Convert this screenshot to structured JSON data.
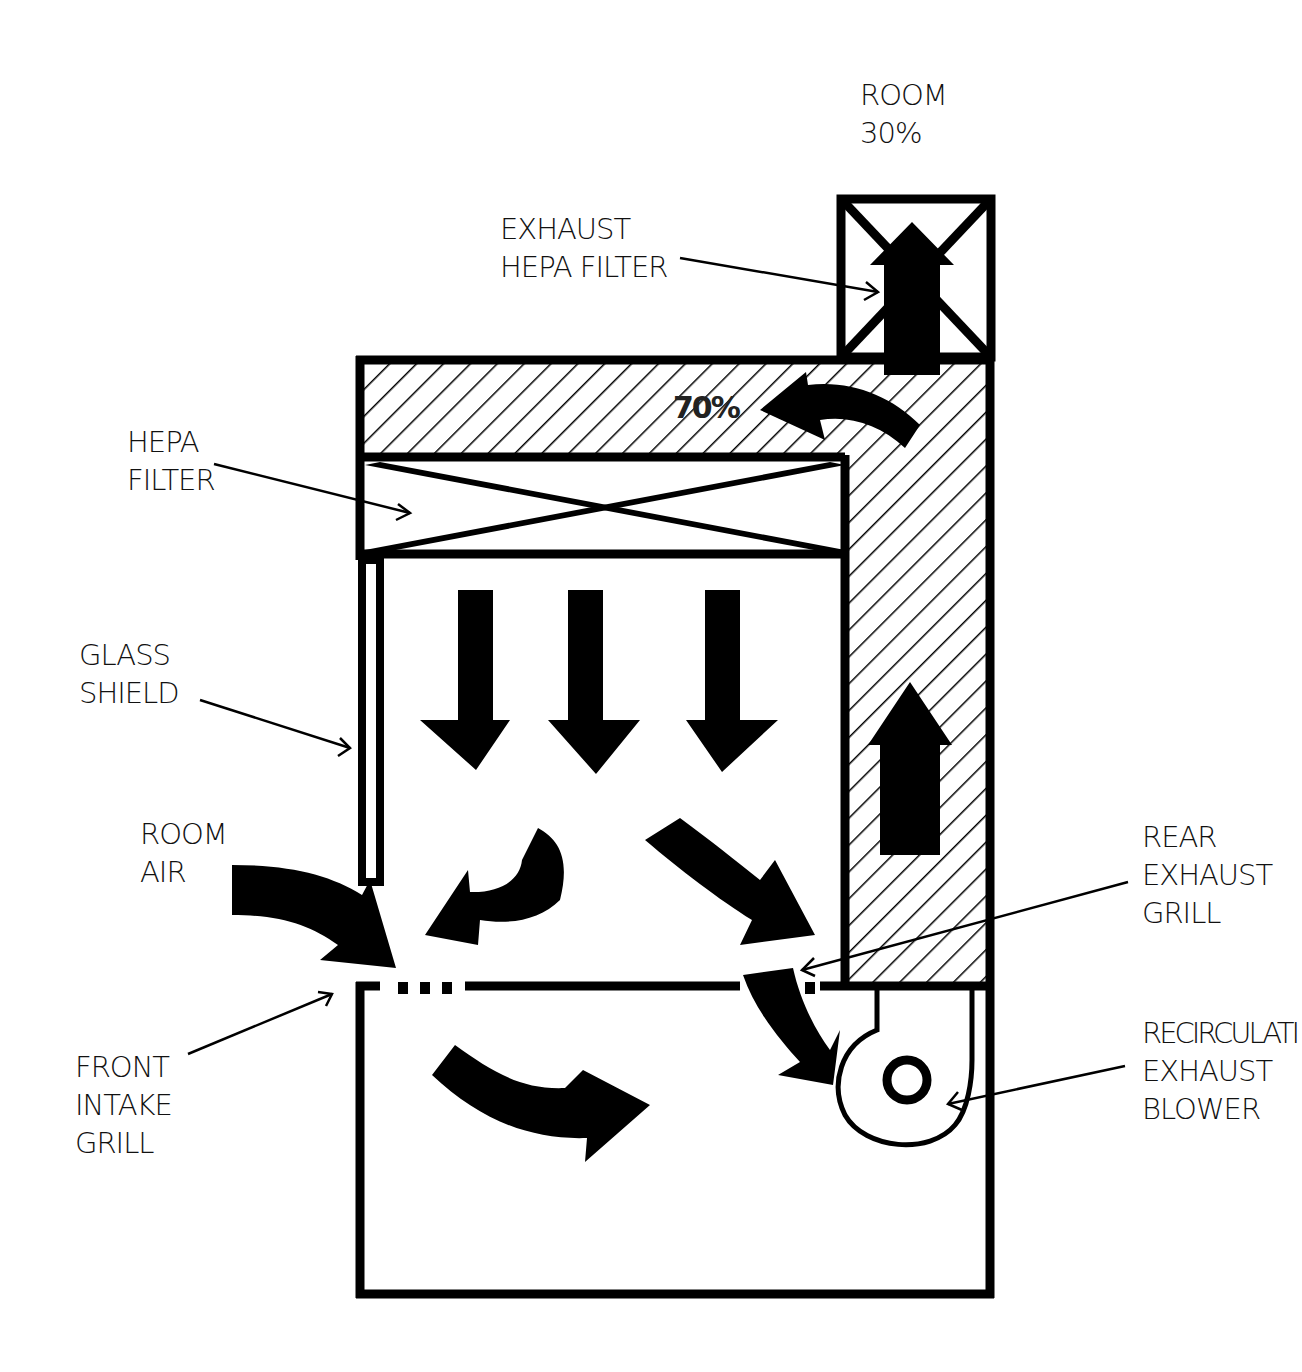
{
  "diagram": {
    "colors": {
      "ink": "#000000",
      "background": "#ffffff",
      "text": "#111111"
    },
    "labels": {
      "room_top": {
        "line1": "ROOM",
        "line2": "30%"
      },
      "exhaust_hepa": {
        "line1": "EXHAUST",
        "line2": "HEPA FILTER"
      },
      "hepa_filter": {
        "line1": "HEPA",
        "line2": "FILTER"
      },
      "glass_shield": {
        "line1": "GLASS",
        "line2": "SHIELD"
      },
      "room_air": {
        "line1": "ROOM",
        "line2": "AIR"
      },
      "front_intake": {
        "line1": "FRONT",
        "line2": "INTAKE",
        "line3": "GRILL"
      },
      "rear_exhaust": {
        "line1": "REAR",
        "line2": "EXHAUST",
        "line3": "GRILL"
      },
      "blower": {
        "line1": "RECIRCULATI",
        "line2": "EXHAUST",
        "line3": "BLOWER"
      },
      "recirc_pct": "70%"
    },
    "icons": [
      "up-arrow-icon",
      "down-arrow-icon",
      "curved-arrow-icon",
      "filter-x-icon",
      "blower-icon"
    ]
  }
}
